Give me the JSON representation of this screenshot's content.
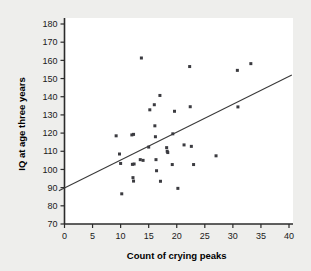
{
  "chart_data": {
    "type": "scatter",
    "title": "",
    "xlabel": "Count of crying peaks",
    "ylabel": "IQ at age three years",
    "xlim": [
      0,
      40
    ],
    "ylim": [
      70,
      180
    ],
    "xticks": [
      0,
      5,
      10,
      15,
      20,
      25,
      30,
      35,
      40
    ],
    "yticks": [
      70,
      80,
      90,
      100,
      110,
      120,
      130,
      140,
      150,
      160,
      170,
      180
    ],
    "xtick_labels": [
      "0",
      "5",
      "10",
      "15",
      "20",
      "25",
      "30",
      "35",
      "40"
    ],
    "ytick_labels": [
      "70",
      "80",
      "90",
      "100",
      "110",
      "120",
      "130",
      "140",
      "150",
      "160",
      "170",
      "180"
    ],
    "grid": false,
    "legend": "none",
    "marker_color": "#3b3b40",
    "line_color": "#3a3a3a",
    "plot_background": "#ffffff",
    "figure_background": "#eeeeec",
    "points": [
      {
        "x": 9.2,
        "y": 118.5
      },
      {
        "x": 9.8,
        "y": 108.5
      },
      {
        "x": 10.0,
        "y": 103.3
      },
      {
        "x": 10.2,
        "y": 86.6
      },
      {
        "x": 12.0,
        "y": 119.0
      },
      {
        "x": 12.3,
        "y": 119.3
      },
      {
        "x": 12.1,
        "y": 102.8
      },
      {
        "x": 12.4,
        "y": 103.0
      },
      {
        "x": 12.2,
        "y": 95.5
      },
      {
        "x": 12.3,
        "y": 93.6
      },
      {
        "x": 13.7,
        "y": 161.3
      },
      {
        "x": 13.5,
        "y": 105.4
      },
      {
        "x": 14.0,
        "y": 105.0
      },
      {
        "x": 15.0,
        "y": 112.3
      },
      {
        "x": 15.2,
        "y": 132.8
      },
      {
        "x": 16.0,
        "y": 135.6
      },
      {
        "x": 16.1,
        "y": 124.0
      },
      {
        "x": 16.2,
        "y": 118.0
      },
      {
        "x": 16.3,
        "y": 105.4
      },
      {
        "x": 16.4,
        "y": 99.3
      },
      {
        "x": 17.0,
        "y": 140.7
      },
      {
        "x": 17.1,
        "y": 93.5
      },
      {
        "x": 18.2,
        "y": 112.0
      },
      {
        "x": 18.3,
        "y": 110.0
      },
      {
        "x": 18.4,
        "y": 109.3
      },
      {
        "x": 19.3,
        "y": 119.6
      },
      {
        "x": 19.2,
        "y": 102.7
      },
      {
        "x": 19.6,
        "y": 132.0
      },
      {
        "x": 20.2,
        "y": 89.6
      },
      {
        "x": 21.3,
        "y": 113.5
      },
      {
        "x": 22.3,
        "y": 156.6
      },
      {
        "x": 22.4,
        "y": 134.5
      },
      {
        "x": 22.6,
        "y": 112.7
      },
      {
        "x": 23.0,
        "y": 102.7
      },
      {
        "x": 27.0,
        "y": 107.5
      },
      {
        "x": 30.8,
        "y": 154.5
      },
      {
        "x": 30.9,
        "y": 134.4
      },
      {
        "x": 33.2,
        "y": 158.2
      }
    ],
    "fit_line": {
      "x0": -1.0,
      "y0": 88.3,
      "x1": 40.5,
      "y1": 152.0
    }
  }
}
